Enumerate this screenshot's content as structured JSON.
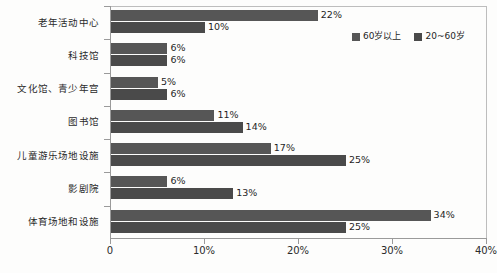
{
  "chart_data": {
    "type": "bar",
    "orientation": "horizontal",
    "title": "",
    "xlabel": "",
    "ylabel": "",
    "xlim": [
      0,
      40
    ],
    "xticks": [
      0,
      10,
      20,
      30,
      40
    ],
    "xticklabels": [
      "0",
      "10%",
      "20%",
      "30%",
      "40%"
    ],
    "grid": false,
    "legend_position": "top-right",
    "categories": [
      "老年活动中心",
      "科技馆",
      "文化馆、青少年宫",
      "图书馆",
      "儿童游乐场地设施",
      "影剧院",
      "体育场地和设施"
    ],
    "series": [
      {
        "name": "60岁以上",
        "color": "#565656",
        "values": [
          22,
          6,
          5,
          11,
          17,
          6,
          34
        ],
        "labels": [
          "22%",
          "6%",
          "5%",
          "11%",
          "17%",
          "6%",
          "34%"
        ]
      },
      {
        "name": "20~60岁",
        "color": "#4a4a4a",
        "values": [
          10,
          6,
          6,
          14,
          25,
          13,
          25
        ],
        "labels": [
          "10%",
          "6%",
          "6%",
          "14%",
          "25%",
          "13%",
          "25%"
        ]
      }
    ]
  },
  "legend": {
    "items": [
      {
        "label": "60岁以上"
      },
      {
        "label": "20~60岁"
      }
    ]
  }
}
